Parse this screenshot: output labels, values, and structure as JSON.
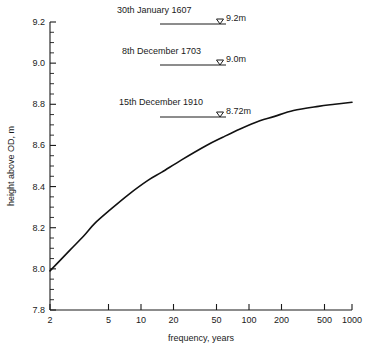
{
  "chart_data": {
    "type": "line",
    "title": "",
    "xlabel": "frequency, years",
    "ylabel": "height above OD, m",
    "xscale": "log",
    "xlim": [
      2,
      1000
    ],
    "ylim": [
      7.8,
      9.2
    ],
    "grid": false,
    "legend": "none",
    "xticks": [
      "2",
      "5",
      "10",
      "20",
      "50",
      "100",
      "200",
      "500",
      "1000"
    ],
    "xtick_values": [
      2,
      5,
      10,
      20,
      50,
      100,
      200,
      500,
      1000
    ],
    "yticks": [
      "7.8",
      "8.0",
      "8.2",
      "8.4",
      "8.6",
      "8.8",
      "9.0",
      "9.2"
    ],
    "ytick_values": [
      7.8,
      8.0,
      8.2,
      8.4,
      8.6,
      8.8,
      9.0,
      9.2
    ],
    "y_minor_tick_interval": 0.05,
    "series": [
      {
        "name": "predicted extreme level",
        "x": [
          2,
          3,
          4,
          5,
          7,
          10,
          15,
          20,
          30,
          50,
          70,
          100,
          150,
          200,
          300,
          500,
          700,
          1000
        ],
        "y": [
          7.99,
          8.09,
          8.16,
          8.22,
          8.29,
          8.36,
          8.43,
          8.47,
          8.53,
          8.6,
          8.64,
          8.68,
          8.72,
          8.74,
          8.77,
          8.79,
          8.8,
          8.81
        ]
      }
    ],
    "annotations": [
      {
        "date": "30th January 1607",
        "value_label": "9.2m",
        "value": 9.2
      },
      {
        "date": "8th December 1703",
        "value_label": "9.0m",
        "value": 9.0
      },
      {
        "date": "15th December 1910",
        "value_label": "8.72m",
        "value": 8.72
      }
    ],
    "colors": {
      "curve": "#111111",
      "axis": "#1a1a1a",
      "background": "#ffffff"
    }
  }
}
